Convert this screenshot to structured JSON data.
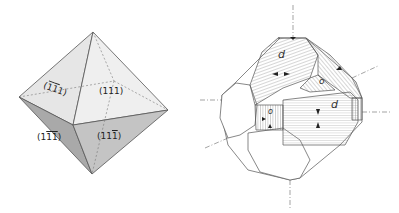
{
  "figure": {
    "left_panel": {
      "type": "octahedron",
      "faces": [
        {
          "label_parts": [
            "(",
            "1",
            "1",
            "1",
            ")"
          ],
          "overline": [
            false,
            true,
            true,
            false,
            false
          ],
          "display": "(1̄1̄1)",
          "position": "upper-left"
        },
        {
          "label_parts": [
            "(",
            "1",
            "1",
            "1",
            ")"
          ],
          "overline": [
            false,
            false,
            false,
            false,
            false
          ],
          "display": "(111)",
          "position": "upper-right"
        },
        {
          "label_parts": [
            "(",
            "1",
            "1",
            "1",
            ")"
          ],
          "overline": [
            false,
            false,
            true,
            true,
            false
          ],
          "display": "(11̄1̄)",
          "position": "lower-left"
        },
        {
          "label_parts": [
            "(",
            "1",
            "1",
            "1",
            ")"
          ],
          "overline": [
            false,
            false,
            false,
            true,
            false
          ],
          "display": "(111̄)",
          "position": "lower-right"
        }
      ]
    },
    "right_panel": {
      "type": "truncated-crystal-with-hatched-faces",
      "face_labels": [
        "d",
        "d",
        "o",
        "o"
      ]
    }
  }
}
